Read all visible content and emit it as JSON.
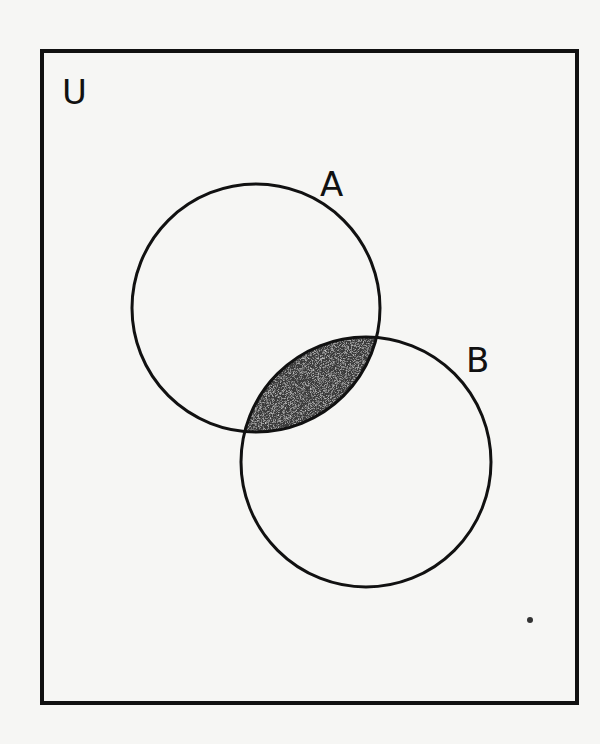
{
  "diagram": {
    "type": "venn",
    "universe": {
      "label": "U",
      "box": {
        "x": 42,
        "y": 51,
        "width": 535,
        "height": 652
      }
    },
    "sets": [
      {
        "label": "A",
        "cx": 256,
        "cy": 308,
        "r": 124,
        "label_x": 336,
        "label_y": 196
      },
      {
        "label": "B",
        "cx": 366,
        "cy": 462,
        "r": 125,
        "label_x": 480,
        "label_y": 372
      }
    ],
    "shaded_region": {
      "description": "A ∩ B",
      "fill": "#3a3a3a"
    },
    "colors": {
      "background": "#f6f6f4",
      "stroke": "#111111",
      "shade": "#3a3a3a"
    },
    "stray_mark": {
      "cx": 530,
      "cy": 620,
      "r": 3
    }
  }
}
